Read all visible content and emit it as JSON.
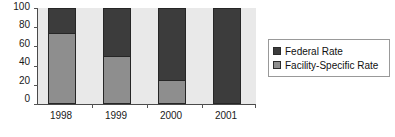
{
  "chart_data": {
    "type": "bar",
    "stacked": true,
    "stacked_percent": true,
    "title": "",
    "subtitle": "",
    "xlabel": "",
    "ylabel": "",
    "categories": [
      "1998",
      "1999",
      "2000",
      "2001"
    ],
    "yticks": [
      "0",
      "20",
      "40",
      "60",
      "80",
      "100"
    ],
    "ylim": [
      0,
      100
    ],
    "grid": false,
    "legend_position": "right",
    "series": [
      {
        "name": "Federal Rate",
        "color": "#3c3c3c",
        "values": [
          25,
          50,
          75,
          100
        ]
      },
      {
        "name": "Facility-Specific Rate",
        "color": "#8e8e8e",
        "values": [
          75,
          50,
          25,
          0
        ]
      }
    ],
    "stack_order_top_to_bottom": [
      "Federal Rate",
      "Facility-Specific Rate"
    ],
    "annotations": []
  },
  "legend": {
    "entries": [
      {
        "label": "Federal Rate",
        "swatch": "legend-swatch-federal"
      },
      {
        "label": "Facility-Specific Rate",
        "swatch": "legend-swatch-facility"
      }
    ]
  },
  "colors": {
    "federal": "#3c3c3c",
    "facility": "#8e8e8e",
    "plot_background": "#e9e9e9",
    "axis": "#4a4a4a",
    "bar_outline": "#262626",
    "page_background": "#ffffff"
  }
}
